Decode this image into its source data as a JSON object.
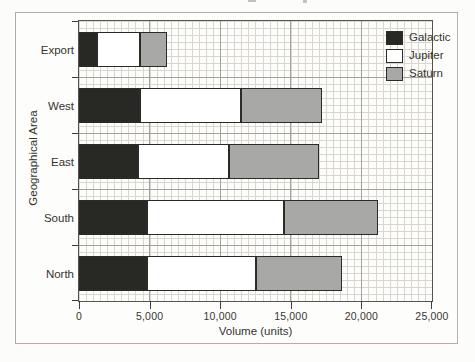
{
  "chart_data": {
    "type": "bar",
    "orientation": "horizontal",
    "stacked": true,
    "title": "",
    "xlabel": "Volume (units)",
    "ylabel": "Geographical Area",
    "xlim": [
      0,
      25000
    ],
    "x_tick_values": [
      0,
      5000,
      10000,
      15000,
      20000,
      25000
    ],
    "x_tick_labels": [
      "0",
      "5,000",
      "10,000",
      "15,000",
      "20,000",
      "25,000"
    ],
    "categories": [
      "Export",
      "West",
      "East",
      "South",
      "North"
    ],
    "series": [
      {
        "name": "Galactic",
        "color": "#282824",
        "values": [
          1250,
          4300,
          4150,
          4850,
          4800
        ]
      },
      {
        "name": "Jupiter",
        "color": "#ffffff",
        "values": [
          3050,
          7150,
          6450,
          9700,
          7750
        ]
      },
      {
        "name": "Saturn",
        "color": "#a8a8a6",
        "values": [
          1900,
          5750,
          6400,
          6650,
          6050
        ]
      }
    ],
    "totals_estimated": [
      6200,
      17200,
      17000,
      21200,
      18600
    ],
    "legend": {
      "position": "top-right",
      "entries": [
        "Galactic",
        "Jupiter",
        "Saturn"
      ]
    },
    "grid": {
      "minor_step_x": 500,
      "major_step_x": 5000,
      "major_h_lines": "category-boundaries",
      "style": "graph-paper"
    }
  }
}
